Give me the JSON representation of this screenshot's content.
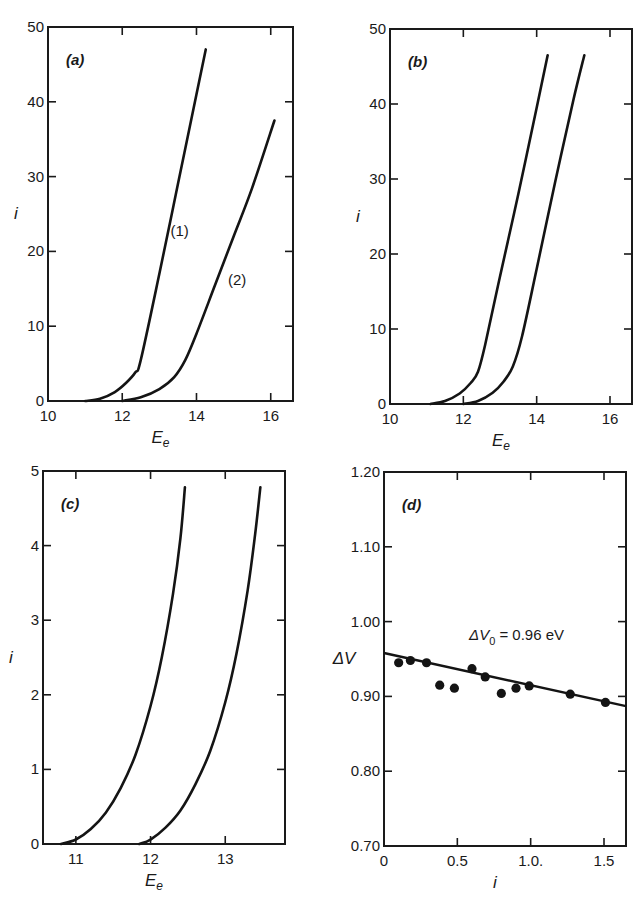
{
  "figure": {
    "panels": [
      "a",
      "b",
      "c",
      "d"
    ]
  },
  "chart_data": [
    {
      "id": "a",
      "type": "line",
      "panel_label": "(a)",
      "title": "",
      "xlabel": "E_e",
      "ylabel": "i",
      "xlim": [
        10,
        16.6
      ],
      "ylim": [
        0,
        50
      ],
      "xticks": [
        10,
        12,
        14,
        16
      ],
      "xtick_labels": [
        "10",
        "12",
        "14",
        "16"
      ],
      "yticks": [
        0,
        10,
        20,
        30,
        40,
        50
      ],
      "ytick_labels": [
        "0",
        "10",
        "20",
        "30",
        "40",
        "50"
      ],
      "grid": false,
      "legend": "none",
      "series": [
        {
          "name": "(1)",
          "x": [
            11.0,
            11.4,
            11.8,
            12.1,
            12.35,
            12.5,
            13.0,
            13.5,
            14.0,
            14.25
          ],
          "y": [
            0,
            0.3,
            1.2,
            2.4,
            3.8,
            5.5,
            17,
            29,
            41,
            47
          ]
        },
        {
          "name": "(2)",
          "x": [
            12.0,
            12.5,
            13.0,
            13.4,
            13.7,
            14.0,
            14.5,
            15.0,
            15.5,
            16.1
          ],
          "y": [
            0,
            0.5,
            1.6,
            3.2,
            5.5,
            9,
            15.5,
            22,
            28.5,
            37.5
          ]
        }
      ],
      "annotations": [
        {
          "text": "(1)",
          "x": 13.3,
          "y": 22
        },
        {
          "text": "(2)",
          "x": 14.85,
          "y": 15.5
        }
      ],
      "box": {
        "left": 48,
        "top": 27,
        "right": 293,
        "bottom": 401
      }
    },
    {
      "id": "b",
      "type": "line",
      "panel_label": "(b)",
      "title": "",
      "xlabel": "E_e",
      "ylabel": "i",
      "xlim": [
        10,
        16.6
      ],
      "ylim": [
        0,
        50
      ],
      "xticks": [
        10,
        12,
        14,
        16
      ],
      "xtick_labels": [
        "10",
        "12",
        "14",
        "16"
      ],
      "yticks": [
        0,
        10,
        20,
        30,
        40,
        50
      ],
      "ytick_labels": [
        "0",
        "10",
        "20",
        "30",
        "40",
        "50"
      ],
      "grid": false,
      "legend": "none",
      "series": [
        {
          "name": "curve-1",
          "x": [
            11.1,
            11.5,
            11.9,
            12.2,
            12.4,
            12.6,
            13.0,
            13.5,
            14.0,
            14.3
          ],
          "y": [
            0,
            0.4,
            1.4,
            2.8,
            4.3,
            8,
            17,
            28,
            39.5,
            46.5
          ]
        },
        {
          "name": "curve-2",
          "x": [
            12.0,
            12.4,
            12.8,
            13.1,
            13.35,
            13.6,
            14.0,
            14.5,
            15.0,
            15.3
          ],
          "y": [
            0,
            0.4,
            1.5,
            3.0,
            5.0,
            9,
            18,
            29.5,
            40.5,
            46.5
          ]
        }
      ],
      "annotations": [],
      "box": {
        "left": 390,
        "top": 29,
        "right": 632,
        "bottom": 404
      }
    },
    {
      "id": "c",
      "type": "line",
      "panel_label": "(c)",
      "title": "",
      "xlabel": "E_e",
      "ylabel": "i",
      "xlim": [
        10.56,
        13.8
      ],
      "ylim": [
        0,
        5
      ],
      "xticks": [
        11,
        12,
        13
      ],
      "xtick_labels": [
        "11",
        "12",
        "13"
      ],
      "yticks": [
        0,
        1,
        2,
        3,
        4,
        5
      ],
      "ytick_labels": [
        "0",
        "1",
        "2",
        "3",
        "4",
        "5"
      ],
      "grid": false,
      "legend": "none",
      "series": [
        {
          "name": "curve-1",
          "x": [
            10.8,
            11.0,
            11.2,
            11.4,
            11.6,
            11.8,
            12.0,
            12.15,
            12.3,
            12.4,
            12.46
          ],
          "y": [
            0,
            0.06,
            0.2,
            0.42,
            0.75,
            1.2,
            1.85,
            2.5,
            3.35,
            4.1,
            4.78
          ]
        },
        {
          "name": "curve-2",
          "x": [
            11.85,
            12.0,
            12.2,
            12.4,
            12.6,
            12.8,
            13.0,
            13.15,
            13.3,
            13.4,
            13.47
          ],
          "y": [
            0,
            0.06,
            0.22,
            0.45,
            0.8,
            1.25,
            1.9,
            2.55,
            3.4,
            4.15,
            4.78
          ]
        }
      ],
      "annotations": [],
      "box": {
        "left": 43,
        "top": 471,
        "right": 285,
        "bottom": 844
      }
    },
    {
      "id": "d",
      "type": "scatter",
      "panel_label": "(d)",
      "title": "",
      "xlabel": "i",
      "ylabel": "ΔV",
      "xlim": [
        0,
        1.65
      ],
      "ylim": [
        0.7,
        1.2
      ],
      "xticks": [
        0,
        0.5,
        1.0,
        1.5
      ],
      "xtick_labels": [
        "0",
        "0.5",
        "1.0.",
        "1.5"
      ],
      "yticks": [
        0.7,
        0.8,
        0.9,
        1.0,
        1.1,
        1.2
      ],
      "ytick_labels": [
        "0.70",
        "0.80",
        "0.90",
        "1.00",
        "1.10",
        "1.20"
      ],
      "grid": false,
      "legend": "none",
      "series": [
        {
          "name": "measured",
          "x": [
            0.1,
            0.18,
            0.29,
            0.38,
            0.48,
            0.6,
            0.69,
            0.8,
            0.9,
            0.99,
            1.27,
            1.51
          ],
          "y": [
            0.945,
            0.948,
            0.945,
            0.915,
            0.911,
            0.937,
            0.926,
            0.904,
            0.911,
            0.914,
            0.903,
            0.892
          ]
        },
        {
          "name": "linear fit",
          "x": [
            0,
            1.65
          ],
          "y": [
            0.958,
            0.887
          ]
        }
      ],
      "annotations": [
        {
          "text": "ΔV",
          "sub": "0",
          "rest": " = 0.96 eV",
          "x": 0.58,
          "y": 0.975
        }
      ],
      "box": {
        "left": 384,
        "top": 472,
        "right": 626,
        "bottom": 846
      }
    }
  ]
}
